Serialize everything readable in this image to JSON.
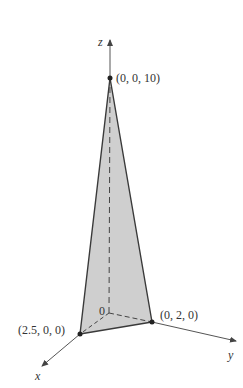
{
  "figure": {
    "type": "3d-tetrahedron-diagram",
    "axes": {
      "x": {
        "label": "x"
      },
      "y": {
        "label": "y"
      },
      "z": {
        "label": "z"
      }
    },
    "origin_label": "0",
    "points": [
      {
        "id": "apex",
        "label": "(0, 0, 10)"
      },
      {
        "id": "x-intercept",
        "label": "(2.5, 0, 0)"
      },
      {
        "id": "y-intercept",
        "label": "(0, 2, 0)"
      }
    ],
    "colors": {
      "face_fill": "#c8c8c8",
      "edge": "#3a3a3a",
      "axis": "#555555",
      "text": "#333333"
    }
  }
}
